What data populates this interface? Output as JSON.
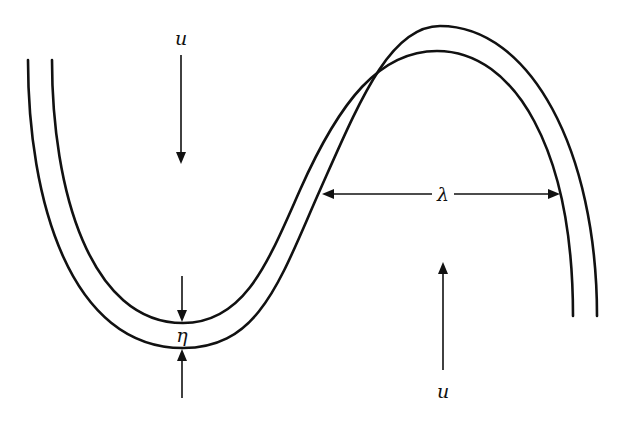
{
  "figure": {
    "caption_fragment": "... p ... g",
    "labels": {
      "flow_top": "u",
      "flow_bottom": "u",
      "thickness": "η",
      "wavelength": "λ"
    },
    "colors": {
      "stroke": "#111111",
      "background": "#ffffff"
    }
  }
}
